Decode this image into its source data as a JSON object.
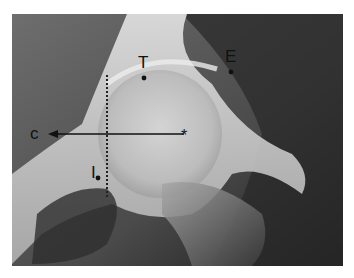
{
  "figure": {
    "type": "annotated radiograph",
    "labels": {
      "T": "T",
      "E": "E",
      "C": "c",
      "I": "I",
      "center_marker": "*"
    },
    "colors": {
      "annotation": "#111111",
      "background": "#ffffff"
    }
  }
}
